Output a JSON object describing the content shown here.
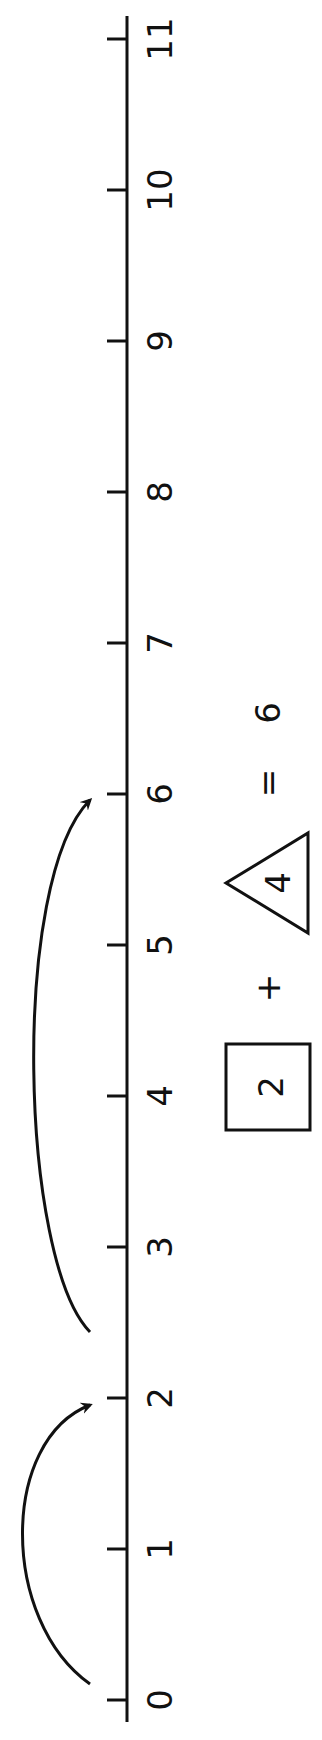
{
  "number_line": {
    "min": 0,
    "max": 11,
    "orientation": "rotated-90-ccw",
    "tick_labels": [
      "0",
      "1",
      "2",
      "3",
      "4",
      "5",
      "6",
      "7",
      "8",
      "9",
      "10",
      "11"
    ]
  },
  "jumps": [
    {
      "from": 0,
      "to": 2
    },
    {
      "from": 2,
      "to": 6
    }
  ],
  "equation": {
    "box_value": "2",
    "plus": "+",
    "triangle_value": "4",
    "equals": "=",
    "result": "6"
  },
  "colors": {
    "ink": "#111111",
    "background": "#ffffff"
  }
}
